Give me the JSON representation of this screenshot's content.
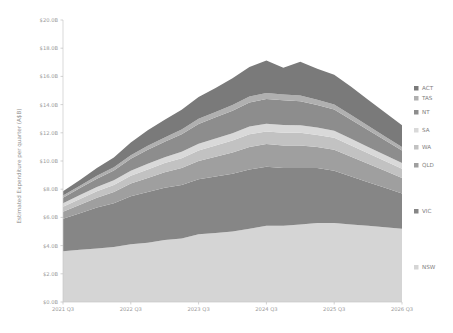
{
  "chart_data": {
    "type": "area",
    "title": "",
    "subtitle": "",
    "xlabel": "",
    "ylabel": "Estimated Expenditure per quarter (A$B)",
    "stacked": true,
    "grid": false,
    "legend_position": "right",
    "ylim": [
      0,
      20
    ],
    "ytick_values": [
      0,
      2,
      4,
      6,
      8,
      10,
      12,
      14,
      16,
      18,
      20
    ],
    "ytick_labels": [
      "$0.0B",
      "$2.0B",
      "$4.0B",
      "$6.0B",
      "$8.0B",
      "$10.0B",
      "$12.0B",
      "$14.0B",
      "$16.0B",
      "$18.0B",
      "$20.0B"
    ],
    "xtick_labels": [
      "2021 Q3",
      "2022 Q3",
      "2023 Q3",
      "2024 Q3",
      "2025 Q3",
      "2026 Q3"
    ],
    "xtick_values": [
      0,
      4,
      8,
      12,
      16,
      20
    ],
    "x": [
      "2021 Q3",
      "2021 Q4",
      "2022 Q1",
      "2022 Q2",
      "2022 Q3",
      "2022 Q4",
      "2023 Q1",
      "2023 Q2",
      "2023 Q3",
      "2023 Q4",
      "2024 Q1",
      "2024 Q2",
      "2024 Q3",
      "2024 Q4",
      "2025 Q1",
      "2025 Q2",
      "2025 Q3",
      "2025 Q4",
      "2026 Q1",
      "2026 Q2",
      "2026 Q3"
    ],
    "series": [
      {
        "name": "NSW",
        "color": "#d5d5d5",
        "values": [
          3.6,
          3.7,
          3.8,
          3.9,
          4.1,
          4.2,
          4.4,
          4.5,
          4.8,
          4.9,
          5.0,
          5.2,
          5.4,
          5.4,
          5.5,
          5.6,
          5.6,
          5.5,
          5.4,
          5.3,
          5.2
        ]
      },
      {
        "name": "VIC",
        "color": "#868686",
        "values": [
          2.3,
          2.6,
          2.9,
          3.1,
          3.4,
          3.6,
          3.7,
          3.8,
          3.9,
          4.0,
          4.1,
          4.2,
          4.2,
          4.1,
          4.0,
          3.9,
          3.7,
          3.4,
          3.1,
          2.8,
          2.5
        ]
      },
      {
        "name": "QLD",
        "color": "#9f9f9f",
        "values": [
          0.5,
          0.6,
          0.7,
          0.8,
          0.9,
          1.0,
          1.1,
          1.2,
          1.3,
          1.4,
          1.5,
          1.6,
          1.6,
          1.6,
          1.6,
          1.5,
          1.5,
          1.4,
          1.3,
          1.2,
          1.1
        ]
      },
      {
        "name": "WA",
        "color": "#c2c2c2",
        "values": [
          0.35,
          0.4,
          0.45,
          0.5,
          0.55,
          0.6,
          0.65,
          0.7,
          0.75,
          0.8,
          0.85,
          0.9,
          0.9,
          0.9,
          0.9,
          0.85,
          0.85,
          0.8,
          0.75,
          0.7,
          0.65
        ]
      },
      {
        "name": "SA",
        "color": "#d9d9d9",
        "values": [
          0.25,
          0.28,
          0.3,
          0.33,
          0.36,
          0.4,
          0.42,
          0.45,
          0.48,
          0.5,
          0.52,
          0.55,
          0.55,
          0.55,
          0.54,
          0.52,
          0.5,
          0.48,
          0.45,
          0.42,
          0.4
        ]
      },
      {
        "name": "NT",
        "color": "#8d8d8d",
        "values": [
          0.4,
          0.5,
          0.6,
          0.7,
          0.85,
          1.0,
          1.1,
          1.25,
          1.4,
          1.5,
          1.6,
          1.7,
          1.75,
          1.75,
          1.7,
          1.6,
          1.5,
          1.35,
          1.2,
          1.05,
          0.9
        ]
      },
      {
        "name": "TAS",
        "color": "#b0b0b0",
        "values": [
          0.15,
          0.17,
          0.2,
          0.22,
          0.25,
          0.28,
          0.3,
          0.33,
          0.36,
          0.38,
          0.4,
          0.42,
          0.43,
          0.42,
          0.4,
          0.38,
          0.36,
          0.33,
          0.3,
          0.27,
          0.24
        ]
      },
      {
        "name": "ACT",
        "color": "#7a7a7a",
        "values": [
          0.3,
          0.4,
          0.55,
          0.7,
          0.9,
          1.1,
          1.25,
          1.4,
          1.55,
          1.7,
          1.9,
          2.1,
          2.3,
          1.9,
          2.4,
          2.2,
          2.1,
          2.0,
          1.85,
          1.7,
          1.55
        ]
      }
    ],
    "legend_order": [
      "ACT",
      "TAS",
      "NT",
      "SA",
      "WA",
      "QLD",
      "VIC",
      "NSW"
    ]
  },
  "colors": {
    "background": "#ffffff",
    "tick_text": "#9a9a9a",
    "axis_label_text": "#8f8f8f",
    "legend_text": "#7d7d7d",
    "spine": "#c9c9c9"
  }
}
